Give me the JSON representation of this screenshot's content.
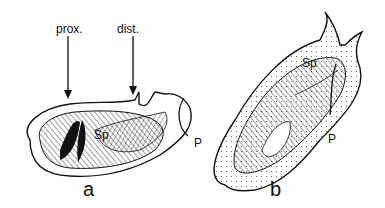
{
  "figure": {
    "panels": [
      {
        "id": "a",
        "label": "a",
        "annotations": {
          "arrow_left": "prox.",
          "arrow_right": "dist.",
          "structure": "Sp",
          "pointer": "P"
        }
      },
      {
        "id": "b",
        "label": "b",
        "annotations": {
          "structure": "Sp",
          "pointer": "P"
        }
      }
    ],
    "colors": {
      "ink": "#111111",
      "background": "#ffffff"
    }
  }
}
